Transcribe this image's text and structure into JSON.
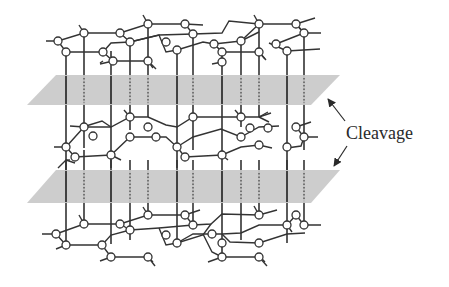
{
  "figure": {
    "label": "Cleavage",
    "colors": {
      "bond": "#333333",
      "atom_fill": "#ffffff",
      "atom_stroke": "#333333",
      "plane": "#c8c8c8",
      "text": "#2a2a2a"
    },
    "layers": [
      "top-sheet",
      "middle-sheet",
      "bottom-sheet"
    ],
    "planes": [
      "upper-cleavage-plane",
      "lower-cleavage-plane"
    ],
    "arrows": [
      "arrow-to-upper-plane",
      "arrow-to-lower-plane"
    ]
  }
}
